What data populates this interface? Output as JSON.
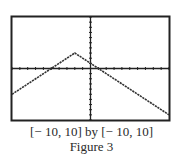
{
  "chart_data": {
    "type": "line",
    "title": "",
    "function": "y = 3 - |x + 2|",
    "xlim": [
      -10,
      10
    ],
    "ylim": [
      -10,
      10
    ],
    "xscale": 1,
    "yscale": 1,
    "grid": false,
    "legend": null,
    "series": [
      {
        "name": "graph",
        "x": [
          -10,
          -2,
          10
        ],
        "y": [
          -5,
          3,
          -9
        ]
      }
    ],
    "window_label": "[−10, 10] by [−10, 10]",
    "figure_label": "Figure 3",
    "xlabel": "",
    "ylabel": ""
  },
  "caption": {
    "window": "[− 10, 10] by [− 10, 10]",
    "figure": "Figure 3"
  },
  "colors": {
    "frame": "#222222",
    "axis": "#222222",
    "line": "#333333"
  }
}
